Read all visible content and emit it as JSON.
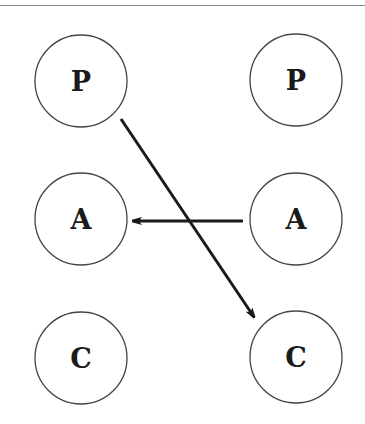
{
  "diagram": {
    "nodes": [
      {
        "id": "p-left",
        "label": "P",
        "cx": 81,
        "cy": 81,
        "r": 46
      },
      {
        "id": "p-right",
        "label": "P",
        "cx": 296,
        "cy": 80,
        "r": 46
      },
      {
        "id": "a-left",
        "label": "A",
        "cx": 81,
        "cy": 219,
        "r": 46
      },
      {
        "id": "a-right",
        "label": "A",
        "cx": 296,
        "cy": 219,
        "r": 46
      },
      {
        "id": "c-left",
        "label": "C",
        "cx": 81,
        "cy": 358,
        "r": 46
      },
      {
        "id": "c-right",
        "label": "C",
        "cx": 296,
        "cy": 357,
        "r": 46
      }
    ],
    "edges": [
      {
        "from": "p-left",
        "to": "c-right",
        "x1": 121,
        "y1": 119,
        "x2": 254,
        "y2": 317
      },
      {
        "from": "a-right",
        "to": "a-left",
        "x1": 243,
        "y1": 221,
        "x2": 133,
        "y2": 221
      }
    ],
    "colors": {
      "stroke": "#444444",
      "arrow": "#1a1a1a",
      "rule": "#8a8a8a"
    }
  }
}
